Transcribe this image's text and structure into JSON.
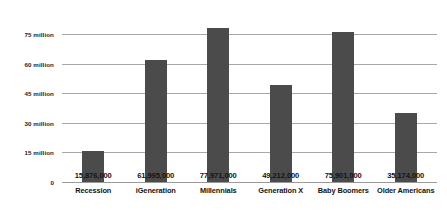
{
  "chart_data": {
    "type": "bar",
    "title": "",
    "subtitle": "",
    "xlabel": "",
    "ylabel": "",
    "categories": [
      "Recession",
      "iGeneration",
      "Millennials",
      "Generation X",
      "Baby Boomers",
      "Older Americans"
    ],
    "values": [
      15876000,
      61995000,
      77971000,
      49212000,
      75901000,
      35174000
    ],
    "value_labels": [
      "15,876,000",
      "61,995,000",
      "77,971,000",
      "49,212,000",
      "75,901,000",
      "35,174,000"
    ],
    "ylim": [
      0,
      75000000
    ],
    "y_ticks": [
      0,
      15000000,
      30000000,
      45000000,
      60000000,
      75000000
    ],
    "y_tick_labels": [
      "0",
      "15 million",
      "30 million",
      "45 million",
      "60 million",
      "75 million"
    ],
    "grid": true,
    "legend": null,
    "colors": {
      "bar": "#4b4b4b",
      "gridline": "#a8a8a8",
      "baseline": "#9a9a9a",
      "text": "#141414",
      "background": "#ffffff"
    }
  }
}
